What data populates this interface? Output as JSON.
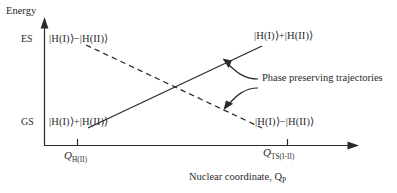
{
  "figure": {
    "type": "energy-level-diagram",
    "axes": {
      "y_title": "Energy",
      "x_title_main": "Nuclear coordinate, Q",
      "x_title_sub": "P",
      "y_levels": [
        {
          "id": "es",
          "label": "ES"
        },
        {
          "id": "gs",
          "label": "GS"
        }
      ],
      "x_ticks": [
        {
          "id": "tick-left",
          "symbol": "Q",
          "subscript": "H(II)"
        },
        {
          "id": "tick-right",
          "symbol": "Q",
          "subscript": "TS(I-II)"
        }
      ]
    },
    "state_labels": [
      {
        "id": "top-left",
        "text": "|H(I)⟩−|H(II)⟩"
      },
      {
        "id": "top-right",
        "text": "|H(I)⟩+|H(II)⟩"
      },
      {
        "id": "bottom-left",
        "text": "|H(I)⟩+|H(II)⟩"
      },
      {
        "id": "bottom-right",
        "text": "|H(I)⟩−|H(II)⟩"
      }
    ],
    "annotation": {
      "text": "Phase preserving trajectories"
    },
    "curves": [
      {
        "id": "solid-rising",
        "style": "solid",
        "from": [
          88,
          128
        ],
        "to": [
          262,
          46
        ]
      },
      {
        "id": "dashed-falling",
        "style": "dashed",
        "from": [
          86,
          45
        ],
        "to": [
          262,
          128
        ]
      }
    ],
    "colors": {
      "line": "#2a2a2a",
      "text": "#2a2a2a",
      "background": "#ffffff"
    }
  }
}
